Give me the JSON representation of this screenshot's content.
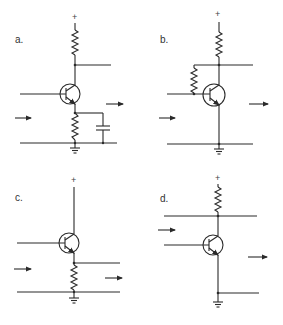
{
  "figure": {
    "panels": [
      {
        "id": "a",
        "label": "a.",
        "supply": "+",
        "config": "common-emitter with emitter bypass capacitor"
      },
      {
        "id": "b",
        "label": "b.",
        "supply": "+",
        "config": "common-emitter with collector-to-base feedback resistor"
      },
      {
        "id": "c",
        "label": "c.",
        "supply": "+",
        "config": "emitter follower (common-collector)"
      },
      {
        "id": "d",
        "label": "d.",
        "supply": "+",
        "config": "common-base"
      }
    ]
  }
}
